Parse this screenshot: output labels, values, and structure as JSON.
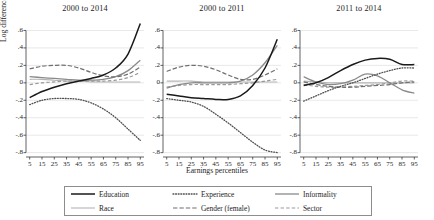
{
  "figure": {
    "xtitle": "Earnings percentiles",
    "ytitle": "Log difference"
  },
  "panels": [
    {
      "title": "2000 to 2014"
    },
    {
      "title": "2000 to 2011"
    },
    {
      "title": "2011 to 2014"
    }
  ],
  "legend": [
    {
      "label": "Education",
      "style": "solid",
      "color": "#1a1a1a",
      "width": 1.5
    },
    {
      "label": "Experience",
      "style": "dotted",
      "color": "#4f4f4f",
      "width": 1.3
    },
    {
      "label": "Informality",
      "style": "solid",
      "color": "#8a8a8a",
      "width": 1.3
    },
    {
      "label": "Race",
      "style": "solid",
      "color": "#b5b5b5",
      "width": 1.1
    },
    {
      "label": "Gender (female)",
      "style": "dashed",
      "color": "#6f6f6f",
      "width": 1.2
    },
    {
      "label": "Sector",
      "style": "dashed",
      "color": "#9a9a9a",
      "width": 1.2
    }
  ],
  "axes": {
    "yticks": [
      ".6",
      ".4",
      ".2",
      "0",
      "-.2",
      "-.4",
      "-.6",
      "-.8"
    ],
    "yvalues": [
      0.6,
      0.4,
      0.2,
      0,
      -0.2,
      -0.4,
      -0.6,
      -0.8
    ],
    "ylim": [
      -0.85,
      0.72
    ],
    "xticks": [
      "5",
      "15",
      "25",
      "35",
      "45",
      "55",
      "65",
      "75",
      "85",
      "95"
    ],
    "xvalues": [
      5,
      15,
      25,
      35,
      45,
      55,
      65,
      75,
      85,
      95
    ],
    "xlim": [
      2,
      98
    ],
    "grid": true
  },
  "chart_data": {
    "type": "line",
    "xlabel": "Earnings percentiles",
    "ylabel": "Log difference",
    "ylim": [
      -0.85,
      0.72
    ],
    "xlim": [
      2,
      98
    ],
    "grid": true,
    "legend_position": "bottom",
    "x": [
      5,
      15,
      25,
      35,
      45,
      55,
      65,
      75,
      85,
      95
    ],
    "panels": [
      {
        "title": "2000 to 2014",
        "series": [
          {
            "name": "Education",
            "values": [
              -0.17,
              -0.1,
              -0.05,
              -0.01,
              0.02,
              0.05,
              0.09,
              0.17,
              0.33,
              0.68
            ]
          },
          {
            "name": "Experience",
            "values": [
              -0.25,
              -0.2,
              -0.18,
              -0.18,
              -0.19,
              -0.23,
              -0.3,
              -0.4,
              -0.53,
              -0.66
            ]
          },
          {
            "name": "Informality",
            "values": [
              0.07,
              0.06,
              0.05,
              0.04,
              0.03,
              0.03,
              0.04,
              0.07,
              0.14,
              0.26
            ]
          },
          {
            "name": "Race",
            "values": [
              0.04,
              0.04,
              0.03,
              0.02,
              0.02,
              0.01,
              0.01,
              0.01,
              0.01,
              0.01
            ]
          },
          {
            "name": "Gender (female)",
            "values": [
              0.16,
              0.19,
              0.2,
              0.2,
              0.17,
              0.12,
              0.08,
              0.07,
              0.1,
              0.18
            ]
          },
          {
            "name": "Sector",
            "values": [
              -0.02,
              0.0,
              0.01,
              0.02,
              0.02,
              0.02,
              0.02,
              0.03,
              0.06,
              0.12
            ]
          }
        ]
      },
      {
        "title": "2000 to 2011",
        "series": [
          {
            "name": "Education",
            "values": [
              -0.13,
              -0.15,
              -0.17,
              -0.18,
              -0.19,
              -0.19,
              -0.15,
              -0.03,
              0.17,
              0.5
            ]
          },
          {
            "name": "Experience",
            "values": [
              -0.18,
              -0.2,
              -0.22,
              -0.27,
              -0.36,
              -0.46,
              -0.57,
              -0.68,
              -0.77,
              -0.8
            ]
          },
          {
            "name": "Informality",
            "values": [
              -0.06,
              -0.02,
              0.0,
              0.0,
              0.0,
              0.0,
              0.02,
              0.09,
              0.23,
              0.43
            ]
          },
          {
            "name": "Race",
            "values": [
              0.02,
              0.02,
              0.02,
              0.01,
              0.01,
              0.01,
              0.01,
              0.01,
              0.01,
              0.01
            ]
          },
          {
            "name": "Gender (female)",
            "values": [
              0.13,
              0.18,
              0.2,
              0.19,
              0.15,
              0.09,
              0.04,
              0.04,
              0.09,
              0.16
            ]
          },
          {
            "name": "Sector",
            "values": [
              -0.05,
              -0.03,
              -0.02,
              -0.02,
              -0.02,
              -0.02,
              -0.01,
              0.0,
              0.02,
              0.04
            ]
          }
        ]
      },
      {
        "title": "2011 to 2014",
        "series": [
          {
            "name": "Education",
            "values": [
              -0.03,
              0.0,
              0.06,
              0.14,
              0.21,
              0.26,
              0.28,
              0.27,
              0.21,
              0.21
            ]
          },
          {
            "name": "Experience",
            "values": [
              -0.21,
              -0.15,
              -0.09,
              -0.04,
              0.0,
              0.05,
              0.1,
              0.14,
              0.17,
              0.17
            ]
          },
          {
            "name": "Informality",
            "values": [
              0.07,
              0.01,
              -0.02,
              -0.01,
              0.03,
              0.1,
              0.08,
              0.0,
              -0.08,
              -0.12
            ]
          },
          {
            "name": "Race",
            "values": [
              0.02,
              0.01,
              0.0,
              0.0,
              0.0,
              0.0,
              0.0,
              0.0,
              0.0,
              0.0
            ]
          },
          {
            "name": "Gender (female)",
            "values": [
              0.01,
              -0.02,
              -0.04,
              -0.05,
              -0.05,
              -0.04,
              -0.03,
              -0.02,
              0.0,
              0.01
            ]
          },
          {
            "name": "Sector",
            "values": [
              -0.02,
              -0.04,
              -0.05,
              -0.05,
              -0.04,
              -0.03,
              -0.02,
              0.0,
              0.02,
              0.02
            ]
          }
        ]
      }
    ]
  }
}
